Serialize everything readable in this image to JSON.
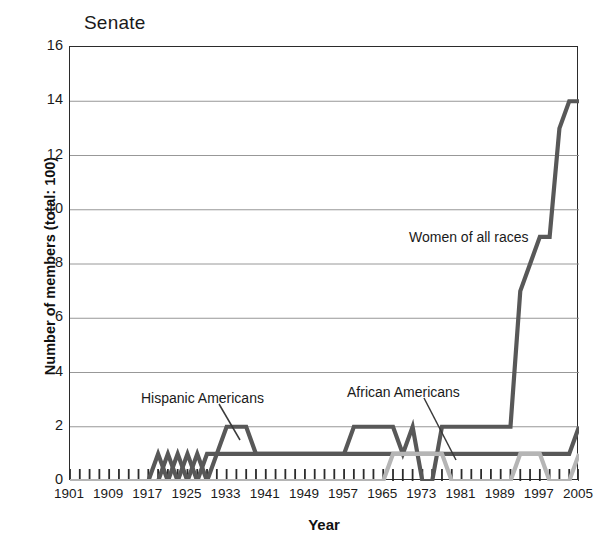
{
  "chart_data": {
    "type": "line",
    "title": "Senate",
    "xlabel": "Year",
    "ylabel": "Number of members (total: 100)",
    "xlim": [
      1901,
      2005
    ],
    "ylim": [
      0,
      16
    ],
    "ytick_step": 2,
    "xtick_step_minor": 2,
    "xtick_step_major": 8,
    "grid": "horizontal",
    "legend": "inline-annotations",
    "yticks": [
      0,
      2,
      4,
      6,
      8,
      10,
      12,
      14,
      16
    ],
    "xticks": [
      1901,
      1909,
      1917,
      1925,
      1933,
      1941,
      1949,
      1957,
      1965,
      1973,
      1981,
      1989,
      1997,
      2005
    ],
    "x": [
      1901,
      1903,
      1905,
      1907,
      1909,
      1911,
      1913,
      1915,
      1917,
      1919,
      1921,
      1923,
      1925,
      1927,
      1929,
      1931,
      1933,
      1935,
      1937,
      1939,
      1941,
      1943,
      1945,
      1947,
      1949,
      1951,
      1953,
      1955,
      1957,
      1959,
      1961,
      1963,
      1965,
      1967,
      1969,
      1971,
      1973,
      1975,
      1977,
      1979,
      1981,
      1983,
      1985,
      1987,
      1989,
      1991,
      1993,
      1995,
      1997,
      1999,
      2001,
      2003,
      2005
    ],
    "series": [
      {
        "name": "Women of all races",
        "color": "#585858",
        "annotation": "Women of all races",
        "values": [
          0,
          0,
          0,
          0,
          0,
          0,
          0,
          0,
          0,
          0,
          1,
          0,
          1,
          0,
          1,
          1,
          1,
          1,
          1,
          1,
          1,
          1,
          1,
          1,
          1,
          1,
          1,
          1,
          1,
          2,
          2,
          2,
          2,
          2,
          1,
          2,
          0,
          0,
          2,
          2,
          2,
          2,
          2,
          2,
          2,
          2,
          7,
          8,
          9,
          9,
          13,
          14,
          14
        ]
      },
      {
        "name": "Hispanic Americans",
        "color": "#585858",
        "annotation": "Hispanic Americans",
        "values": [
          0,
          0,
          0,
          0,
          0,
          0,
          0,
          0,
          0,
          1,
          0,
          1,
          0,
          1,
          0,
          1,
          2,
          2,
          2,
          1,
          1,
          1,
          1,
          1,
          1,
          1,
          1,
          1,
          1,
          1,
          1,
          1,
          1,
          1,
          1,
          1,
          1,
          1,
          1,
          1,
          1,
          1,
          1,
          1,
          1,
          1,
          1,
          1,
          1,
          1,
          1,
          1,
          2
        ]
      },
      {
        "name": "African Americans",
        "color": "#b5b5b5",
        "annotation": "African Americans",
        "values": [
          0,
          0,
          0,
          0,
          0,
          0,
          0,
          0,
          0,
          0,
          0,
          0,
          0,
          0,
          0,
          0,
          0,
          0,
          0,
          0,
          0,
          0,
          0,
          0,
          0,
          0,
          0,
          0,
          0,
          0,
          0,
          0,
          0,
          1,
          1,
          1,
          1,
          1,
          1,
          0,
          0,
          0,
          0,
          0,
          0,
          0,
          1,
          1,
          1,
          0,
          0,
          0,
          1
        ]
      }
    ],
    "annotations": [
      {
        "label": "Women of all races",
        "x": 409,
        "y": 229
      },
      {
        "label": "Hispanic Americans",
        "x": 141,
        "y": 390
      },
      {
        "label": "African Americans",
        "x": 347,
        "y": 384
      }
    ],
    "colors": {
      "axis": "#2b2b2b",
      "gridline": "#8c8c8c",
      "series_dark": "#585858",
      "series_light": "#b5b5b5",
      "text": "#1a1a1a",
      "background": "#ffffff"
    }
  }
}
